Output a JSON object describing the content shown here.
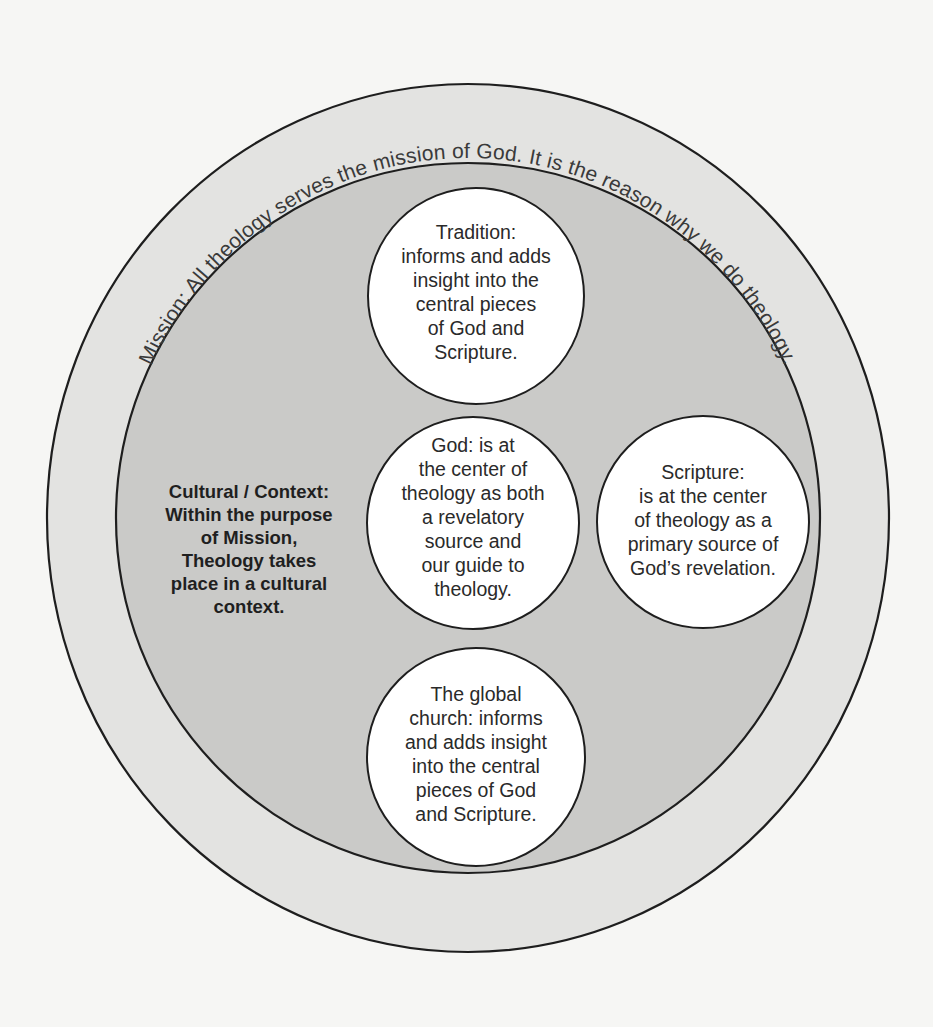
{
  "diagram": {
    "type": "concentric-circles",
    "colors": {
      "background": "#f6f6f4",
      "outer_ring": "#e3e3e1",
      "inner_field": "#cacac8",
      "bubble": "#ffffff",
      "stroke": "#1e1e1e",
      "text": "#2a2a2a"
    },
    "outer_ring": {
      "label": "Mission: All theology serves the mission of God. It is the reason why we do theology."
    },
    "inner_field": {
      "lines": [
        "Cultural / Context:",
        "Within the purpose",
        "of Mission,",
        "Theology takes",
        "place in a cultural",
        "context."
      ]
    },
    "bubbles": [
      {
        "id": "tradition",
        "lines": [
          "Tradition:",
          "informs and adds",
          "insight into the",
          "central pieces",
          "of God and",
          "Scripture."
        ]
      },
      {
        "id": "god",
        "lines": [
          "God: is at",
          "the center of",
          "theology as both",
          "a revelatory",
          "source and",
          "our guide to",
          "theology."
        ]
      },
      {
        "id": "scripture",
        "lines": [
          "Scripture:",
          "is at the center",
          "of theology as a",
          "primary source of",
          "God’s revelation."
        ]
      },
      {
        "id": "global-church",
        "lines": [
          "The global",
          "church: informs",
          "and adds insight",
          "into the central",
          "pieces of God",
          "and Scripture."
        ]
      }
    ]
  }
}
